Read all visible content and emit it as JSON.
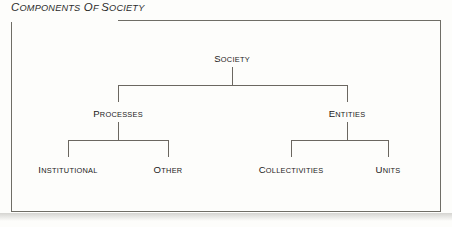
{
  "figure": {
    "title": "Components of Society",
    "title_display": {
      "lead": "C",
      "rest": "OMPONENTS"
    },
    "border_color": "#6f6d66",
    "line_color": "#6b6760",
    "text_color": "#222020",
    "background_color": "#fdfdfb"
  },
  "diagram": {
    "type": "hierarchy-tree",
    "levels": 3,
    "root": {
      "id": "society",
      "label": "Society",
      "lead": "S",
      "rest": "OCIETY"
    },
    "level2": [
      {
        "id": "processes",
        "label": "Processes",
        "lead": "P",
        "rest": "ROCESSES"
      },
      {
        "id": "entities",
        "label": "Entities",
        "lead": "E",
        "rest": "NTITIES"
      }
    ],
    "level3": [
      {
        "id": "institutional",
        "label": "Institutional",
        "lead": "I",
        "rest": "NSTITUTIONAL",
        "parent": "processes"
      },
      {
        "id": "other",
        "label": "Other",
        "lead": "O",
        "rest": "THER",
        "parent": "processes"
      },
      {
        "id": "collectivities",
        "label": "Collectivities",
        "lead": "C",
        "rest": "OLLECTIVITIES",
        "parent": "entities"
      },
      {
        "id": "units",
        "label": "Units",
        "lead": "U",
        "rest": "NITS",
        "parent": "entities"
      }
    ],
    "edges": [
      {
        "from": "society",
        "to": "processes"
      },
      {
        "from": "society",
        "to": "entities"
      },
      {
        "from": "processes",
        "to": "institutional"
      },
      {
        "from": "processes",
        "to": "other"
      },
      {
        "from": "entities",
        "to": "collectivities"
      },
      {
        "from": "entities",
        "to": "units"
      }
    ]
  }
}
